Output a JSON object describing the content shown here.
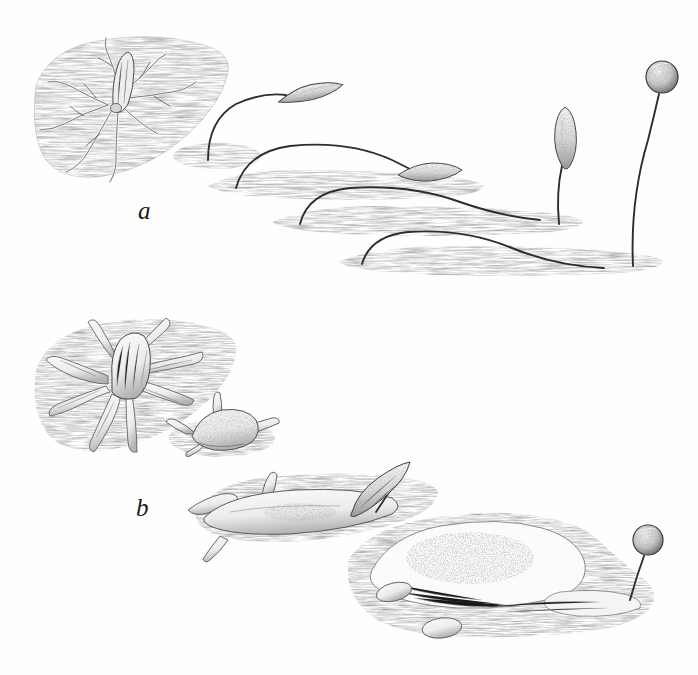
{
  "figure": {
    "kind": "scientific-engraving",
    "medium": "hatched pen-and-ink lithograph, grayscale",
    "background_color": "#fefefe",
    "ink_color": "#2b2b2b",
    "substrate_tone": "#8d8d8d",
    "width_px": 698,
    "height_px": 675,
    "labels": [
      {
        "id": "a",
        "text": "a",
        "x": 138,
        "y": 198
      },
      {
        "id": "b",
        "text": "b",
        "x": 136,
        "y": 495
      }
    ],
    "series": [
      {
        "id": "a",
        "label": "a",
        "description": "Development series a: a branched filose amoeboid cell on a substrate patch, followed by progressively longer arching stalks bearing elongate spindle-shaped sporangia, ending in an erect stalk with a globose sporangium.",
        "stages": [
          {
            "index": 1,
            "name": "amoeboid-cell-filose",
            "sporangium": "none",
            "substrate": "large-triangular-patch"
          },
          {
            "index": 2,
            "name": "short-arched-stalk",
            "sporangium": "spindle",
            "substrate": "small-oval-patch"
          },
          {
            "index": 3,
            "name": "long-arched-stalk",
            "sporangium": "spindle",
            "substrate": "elongate-patch"
          },
          {
            "index": 4,
            "name": "longer-arched-stalk",
            "sporangium": "spindle-erect",
            "substrate": "elongate-patch"
          },
          {
            "index": 5,
            "name": "tall-erect-stalk",
            "sporangium": "globose",
            "substrate": "elongate-patch"
          }
        ]
      },
      {
        "id": "b",
        "label": "b",
        "description": "Development series b: a lobose plasmodium with blunt conical pseudopodia on a substrate patch, maturing through multi-lobed stages to a broad granular plasmodium bearing a short erect stalk with a globose sporangium.",
        "stages": [
          {
            "index": 1,
            "name": "plasmodium-lobose",
            "sporangium": "none",
            "substrate": "large-triangular-patch"
          },
          {
            "index": 2,
            "name": "plasmodium-four-horned",
            "sporangium": "none",
            "substrate": "small-oval-patch"
          },
          {
            "index": 3,
            "name": "plasmodium-elongating",
            "sporangium": "emergent-spindle",
            "substrate": "elongate-patch"
          },
          {
            "index": 4,
            "name": "plasmodium-broad-granular",
            "sporangium": "globose-stalked",
            "substrate": "large-lobed-patch"
          }
        ]
      }
    ],
    "bleed_through_note": "faint ghost of text printed on the reverse of the page, bottom margin"
  }
}
